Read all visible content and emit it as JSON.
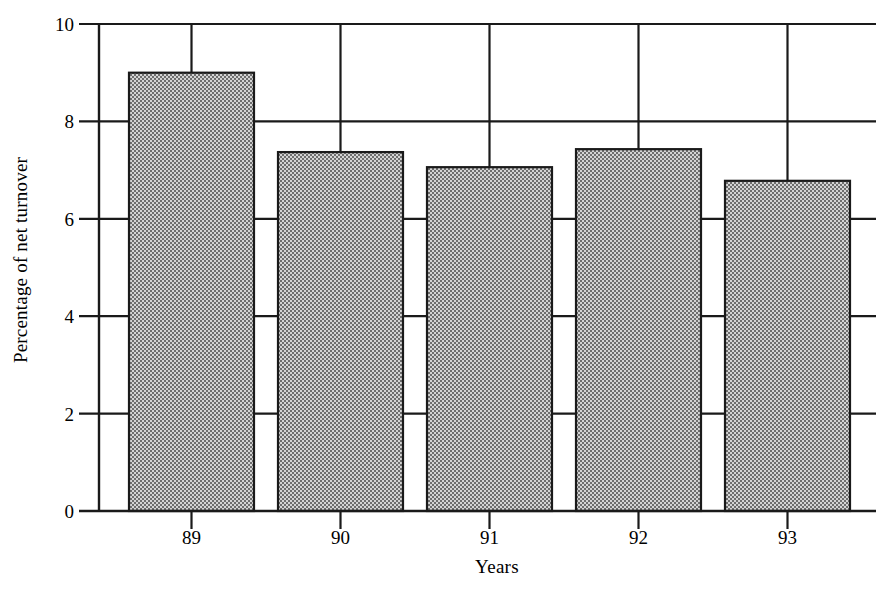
{
  "chart_data": {
    "type": "bar",
    "title": "",
    "subtitle": "",
    "xlabel": "Years",
    "ylabel": "Percentage of net turnover",
    "categories": [
      "89",
      "90",
      "91",
      "92",
      "93"
    ],
    "values": [
      9.0,
      7.37,
      7.06,
      7.43,
      6.78
    ],
    "series": [
      {
        "name": "Percentage of net turnover",
        "values": [
          9.0,
          7.37,
          7.06,
          7.43,
          6.78
        ]
      }
    ],
    "ylim": [
      0,
      10
    ],
    "ytick_values": [
      0,
      2,
      4,
      6,
      8,
      10
    ],
    "ytick_labels": [
      "0",
      "2",
      "4",
      "6",
      "8",
      "10"
    ],
    "xtick_labels": [
      "89",
      "90",
      "91",
      "92",
      "93"
    ],
    "grid": "horizontal",
    "gridlines_at": [
      2,
      4,
      6,
      8,
      10
    ],
    "legend": "none",
    "legend_position": "none",
    "bar_fill": "#a8a8a8",
    "bar_fill_pattern": "checkerboard-dither-50-percent",
    "bar_edge_color": "#1a1a1a",
    "axis_color": "#1a1a1a",
    "background_color": "#ffffff",
    "annotations": []
  },
  "axes": {
    "y_axis_name": "y-axis",
    "x_axis_name": "x-axis",
    "baseline_name": "zero-baseline"
  },
  "figure": {
    "plot_left_px": 117,
    "plot_right_px": 876,
    "plot_top_value": 10,
    "plot_bottom_value": 0
  }
}
